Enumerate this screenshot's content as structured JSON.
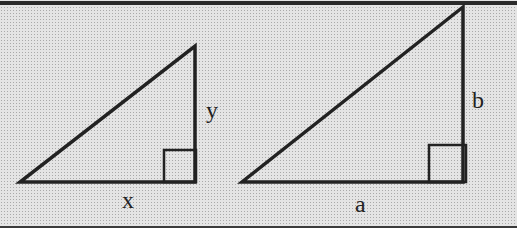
{
  "figure": {
    "colors": {
      "background": "#e4e4e4",
      "stroke": "#222222",
      "border": "#2a2a2a"
    },
    "triangles": [
      {
        "id": "small-triangle",
        "vertices": {
          "left": [
            20,
            182
          ],
          "right_angle": [
            195,
            182
          ],
          "top": [
            195,
            46
          ]
        },
        "right_angle_marker": {
          "x": 164,
          "y": 150,
          "size": 32
        },
        "labels": {
          "base": {
            "text": "x",
            "x": 122,
            "y": 208
          },
          "height": {
            "text": "y",
            "x": 206,
            "y": 118
          }
        }
      },
      {
        "id": "large-triangle",
        "vertices": {
          "left": [
            242,
            182
          ],
          "right_angle": [
            463,
            182
          ],
          "top": [
            463,
            7
          ]
        },
        "right_angle_marker": {
          "x": 429,
          "y": 145,
          "size": 37
        },
        "labels": {
          "base": {
            "text": "a",
            "x": 355,
            "y": 212
          },
          "height": {
            "text": "b",
            "x": 472,
            "y": 108
          }
        }
      }
    ]
  }
}
